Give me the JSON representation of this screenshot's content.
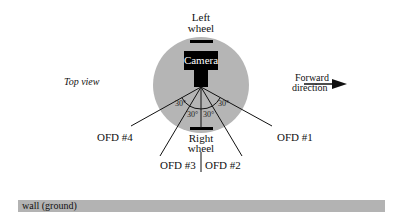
{
  "diagram": {
    "view_label": "Top view",
    "left_wheel_label": [
      "Left",
      "wheel"
    ],
    "right_wheel_label": [
      "Right",
      "wheel"
    ],
    "camera_label": "Camera",
    "forward_label": [
      "Forward",
      "direction"
    ],
    "angles": [
      "30°",
      "30°",
      "30°",
      "30°"
    ],
    "sensors": [
      "OFD #1",
      "OFD #2",
      "OFD #3",
      "OFD #4"
    ],
    "wall_label": "wall (ground)",
    "colors": {
      "robot_body": "#b5b5b5",
      "camera": "#000000",
      "wall": "#b3b3b3",
      "lines": "#111111"
    }
  }
}
